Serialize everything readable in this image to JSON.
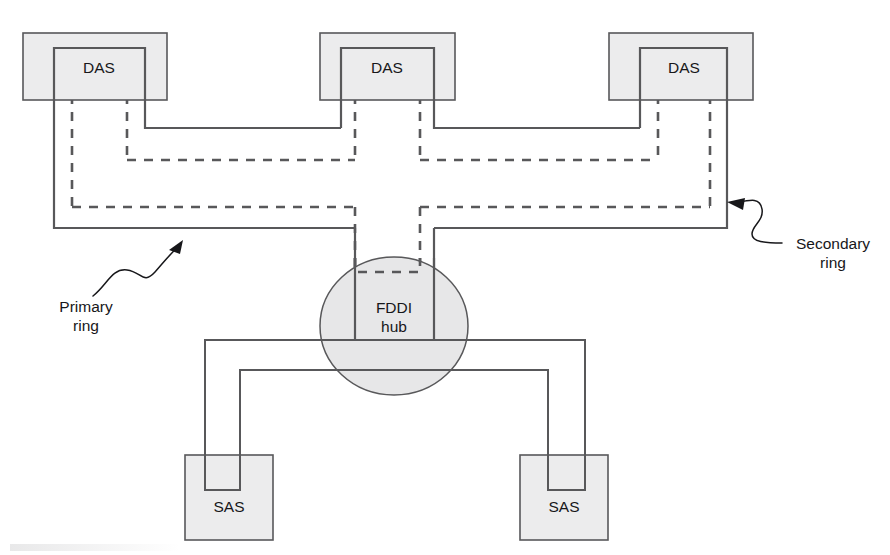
{
  "diagram": {
    "canvas": {
      "width": 890,
      "height": 555
    },
    "colors": {
      "node_fill": "#ececed",
      "hub_fill": "#e7e7e8",
      "line": "#58585a",
      "text": "#17171a",
      "background": "#ffffff"
    },
    "nodes": {
      "das_left": {
        "label": "DAS"
      },
      "das_middle": {
        "label": "DAS"
      },
      "das_right": {
        "label": "DAS"
      },
      "hub": {
        "label_line1": "FDDI",
        "label_line2": "hub"
      },
      "sas_left": {
        "label": "SAS"
      },
      "sas_right": {
        "label": "SAS"
      }
    },
    "annotations": {
      "primary": {
        "label_line1": "Primary",
        "label_line2": "ring",
        "style": "solid"
      },
      "secondary": {
        "label_line1": "Secondary",
        "label_line2": "ring",
        "style": "dashed"
      }
    }
  }
}
